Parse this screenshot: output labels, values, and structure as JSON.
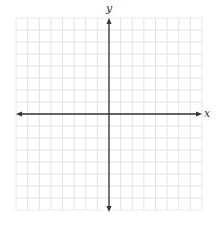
{
  "diagram": {
    "type": "coordinate-plane",
    "x_axis_label": "x",
    "y_axis_label": "y",
    "grid": {
      "columns": 16,
      "rows": 16,
      "left": 16,
      "top": 18,
      "right": 202,
      "bottom": 210,
      "line_color": "#dcdcdc",
      "border_color": "#e2e2e2"
    },
    "axes": {
      "color": "#333333",
      "x_axis_y": 114,
      "y_axis_x": 109,
      "arrows": "both-ends"
    }
  }
}
